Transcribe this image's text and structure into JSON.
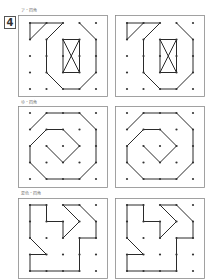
{
  "problem_number": "4",
  "colors": {
    "frame": "#8a8a8a",
    "line": "#2a2a2a",
    "dot": "#333333"
  },
  "grid": {
    "cols_x_offsets": [
      0,
      16.5,
      33,
      49.5,
      66
    ],
    "rows_y_offsets": [
      0,
      16.5,
      33,
      49.5,
      66
    ]
  },
  "sections": [
    {
      "label": "ア・四角",
      "label_y": 8,
      "frame_y": 15,
      "frame_h": 81,
      "origin_y": 23,
      "panels": [
        {
          "name": "model",
          "frame_x": 18,
          "origin_x": 30
        },
        {
          "name": "answer",
          "frame_x": 115,
          "origin_x": 127
        }
      ],
      "segments": [
        [
          [
            0,
            0
          ],
          [
            1,
            0
          ]
        ],
        [
          [
            0,
            0
          ],
          [
            0,
            1
          ]
        ],
        [
          [
            0,
            1
          ],
          [
            1,
            0
          ]
        ],
        [
          [
            1,
            0
          ],
          [
            2,
            0
          ]
        ],
        [
          [
            2,
            0
          ],
          [
            1,
            1
          ]
        ],
        [
          [
            1,
            1
          ],
          [
            1,
            3
          ]
        ],
        [
          [
            1,
            3
          ],
          [
            2,
            4
          ]
        ],
        [
          [
            2,
            4
          ],
          [
            3,
            4
          ]
        ],
        [
          [
            3,
            4
          ],
          [
            4,
            3
          ]
        ],
        [
          [
            4,
            3
          ],
          [
            4,
            1
          ]
        ],
        [
          [
            4,
            1
          ],
          [
            3,
            0
          ]
        ],
        [
          [
            2,
            1
          ],
          [
            3,
            1
          ]
        ],
        [
          [
            3,
            1
          ],
          [
            3,
            3
          ]
        ],
        [
          [
            3,
            3
          ],
          [
            2,
            3
          ]
        ],
        [
          [
            2,
            3
          ],
          [
            2,
            1
          ]
        ],
        [
          [
            2,
            1
          ],
          [
            3,
            3
          ]
        ],
        [
          [
            3,
            1
          ],
          [
            2,
            3
          ]
        ]
      ]
    },
    {
      "label": "ゆ・四角",
      "label_y": 100,
      "frame_y": 106,
      "frame_h": 81,
      "origin_y": 113,
      "panels": [
        {
          "name": "model",
          "frame_x": 18,
          "origin_x": 30
        },
        {
          "name": "answer",
          "frame_x": 115,
          "origin_x": 127
        }
      ],
      "segments": [
        [
          [
            1,
            0
          ],
          [
            3,
            0
          ]
        ],
        [
          [
            0,
            1
          ],
          [
            1,
            0
          ]
        ],
        [
          [
            3,
            0
          ],
          [
            4,
            1
          ]
        ],
        [
          [
            4,
            1
          ],
          [
            4,
            3
          ]
        ],
        [
          [
            4,
            3
          ],
          [
            3,
            4
          ]
        ],
        [
          [
            3,
            4
          ],
          [
            1,
            4
          ]
        ],
        [
          [
            1,
            4
          ],
          [
            0,
            3
          ]
        ],
        [
          [
            0,
            3
          ],
          [
            0,
            2
          ]
        ],
        [
          [
            0,
            2
          ],
          [
            1,
            1
          ]
        ],
        [
          [
            1,
            1
          ],
          [
            2,
            1
          ]
        ],
        [
          [
            2,
            1
          ],
          [
            3,
            2
          ]
        ],
        [
          [
            3,
            2
          ],
          [
            2,
            3
          ]
        ],
        [
          [
            2,
            3
          ],
          [
            1,
            2
          ]
        ]
      ]
    },
    {
      "label": "夏色・四角",
      "label_y": 191,
      "frame_y": 198,
      "frame_h": 80,
      "origin_y": 205,
      "panels": [
        {
          "name": "model",
          "frame_x": 18,
          "origin_x": 30
        },
        {
          "name": "answer",
          "frame_x": 115,
          "origin_x": 127
        }
      ],
      "segments": [
        [
          [
            0,
            0
          ],
          [
            1,
            0
          ]
        ],
        [
          [
            1,
            0
          ],
          [
            1,
            1
          ]
        ],
        [
          [
            1,
            1
          ],
          [
            2,
            1
          ]
        ],
        [
          [
            2,
            1
          ],
          [
            2,
            2
          ]
        ],
        [
          [
            2,
            2
          ],
          [
            3,
            1
          ]
        ],
        [
          [
            3,
            1
          ],
          [
            2,
            0
          ]
        ],
        [
          [
            2,
            0
          ],
          [
            3,
            0
          ]
        ],
        [
          [
            3,
            0
          ],
          [
            4,
            1
          ]
        ],
        [
          [
            4,
            1
          ],
          [
            4,
            2
          ]
        ],
        [
          [
            4,
            2
          ],
          [
            3,
            2
          ]
        ],
        [
          [
            3,
            2
          ],
          [
            3,
            4
          ]
        ],
        [
          [
            3,
            4
          ],
          [
            0,
            4
          ]
        ],
        [
          [
            0,
            4
          ],
          [
            0,
            3
          ]
        ],
        [
          [
            0,
            3
          ],
          [
            1,
            3
          ]
        ],
        [
          [
            1,
            3
          ],
          [
            0,
            2
          ]
        ],
        [
          [
            0,
            2
          ],
          [
            0,
            0
          ]
        ]
      ]
    }
  ]
}
